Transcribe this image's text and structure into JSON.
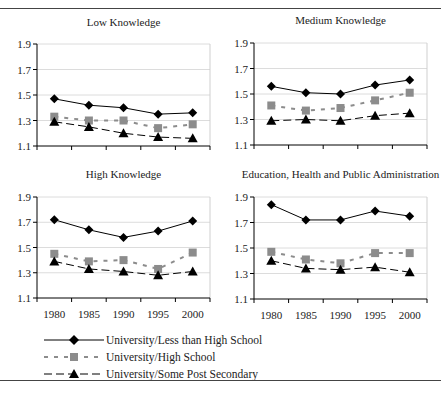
{
  "chart_data": [
    {
      "type": "line",
      "title": "Low Knowledge",
      "x": [
        1980,
        1985,
        1990,
        1995,
        2000
      ],
      "ylim": [
        1.1,
        1.9
      ],
      "yticks": [
        1.1,
        1.3,
        1.5,
        1.7,
        1.9
      ],
      "grid": true,
      "series": [
        {
          "name": "University/Less than High School",
          "values": [
            1.47,
            1.42,
            1.4,
            1.35,
            1.36
          ]
        },
        {
          "name": "University/High School",
          "values": [
            1.33,
            1.3,
            1.3,
            1.24,
            1.27
          ]
        },
        {
          "name": "University/Some Post Secondary",
          "values": [
            1.29,
            1.25,
            1.2,
            1.17,
            1.16
          ]
        }
      ]
    },
    {
      "type": "line",
      "title": "Medium Knowledge",
      "x": [
        1980,
        1985,
        1990,
        1995,
        2000
      ],
      "ylim": [
        1.1,
        1.9
      ],
      "yticks": [
        1.1,
        1.3,
        1.5,
        1.7,
        1.9
      ],
      "grid": true,
      "series": [
        {
          "name": "University/Less than High School",
          "values": [
            1.56,
            1.51,
            1.5,
            1.57,
            1.61
          ]
        },
        {
          "name": "University/High School",
          "values": [
            1.41,
            1.37,
            1.39,
            1.45,
            1.51
          ]
        },
        {
          "name": "University/Some Post Secondary",
          "values": [
            1.29,
            1.3,
            1.29,
            1.33,
            1.35
          ]
        }
      ]
    },
    {
      "type": "line",
      "title": "High Knowledge",
      "x": [
        1980,
        1985,
        1990,
        1995,
        2000
      ],
      "ylim": [
        1.1,
        1.9
      ],
      "yticks": [
        1.1,
        1.3,
        1.5,
        1.7,
        1.9
      ],
      "grid": true,
      "series": [
        {
          "name": "University/Less than High School",
          "values": [
            1.72,
            1.64,
            1.58,
            1.63,
            1.71
          ]
        },
        {
          "name": "University/High School",
          "values": [
            1.45,
            1.39,
            1.4,
            1.33,
            1.46
          ]
        },
        {
          "name": "University/Some Post Secondary",
          "values": [
            1.39,
            1.33,
            1.31,
            1.28,
            1.31
          ]
        }
      ]
    },
    {
      "type": "line",
      "title": "Education, Health and Public Administration",
      "x": [
        1980,
        1985,
        1990,
        1995,
        2000
      ],
      "ylim": [
        1.1,
        1.9
      ],
      "yticks": [
        1.1,
        1.3,
        1.5,
        1.7,
        1.9
      ],
      "grid": true,
      "series": [
        {
          "name": "University/Less than High School",
          "values": [
            1.84,
            1.72,
            1.72,
            1.79,
            1.75
          ]
        },
        {
          "name": "University/High School",
          "values": [
            1.47,
            1.41,
            1.38,
            1.46,
            1.46
          ]
        },
        {
          "name": "University/Some Post Secondary",
          "values": [
            1.4,
            1.34,
            1.33,
            1.35,
            1.31
          ]
        }
      ]
    }
  ],
  "panels": [
    {
      "title": "Low Knowledge"
    },
    {
      "title": "Medium Knowledge"
    },
    {
      "title": "High Knowledge"
    },
    {
      "title": "Education, Health and Public Administration"
    }
  ],
  "yticks": [
    "1.1",
    "1.3",
    "1.5",
    "1.7",
    "1.9"
  ],
  "xticks": [
    "1980",
    "1985",
    "1990",
    "1995",
    "2000"
  ],
  "legend": [
    {
      "label": "University/Less than High School",
      "marker": "diamond",
      "line": "solid",
      "color": "#000000"
    },
    {
      "label": "University/High School",
      "marker": "square",
      "line": "dotted",
      "color": "#8c8c8c"
    },
    {
      "label": "University/Some Post Secondary",
      "marker": "triangle",
      "line": "dashed",
      "color": "#000000"
    }
  ]
}
